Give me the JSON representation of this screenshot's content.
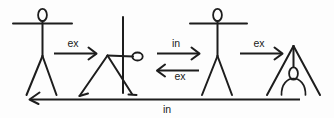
{
  "diagram": {
    "background_color": "#fdfdfd",
    "ink_color": "#1d1d1d",
    "figures": [
      {
        "id": "figure-standing-1",
        "name": "standing-figure",
        "pose": "standing upright, arms outstretched horizontally",
        "position": 1
      },
      {
        "id": "figure-forward-bend",
        "name": "forward-bend-figure",
        "pose": "bent forward at hips, back horizontal, arms raised vertically",
        "position": 2
      },
      {
        "id": "figure-standing-2",
        "name": "standing-figure",
        "pose": "standing upright, arms outstretched horizontally",
        "position": 3
      },
      {
        "id": "figure-deep-fold",
        "name": "deep-forward-fold-figure",
        "pose": "deep forward fold, head down between legs, arms hanging",
        "position": 4
      }
    ],
    "arrows": [
      {
        "id": "arrow-1",
        "name": "arrow-ex-1",
        "label": "ex",
        "direction": "right",
        "label_position": "above",
        "from": "figure-standing-1",
        "to": "figure-forward-bend"
      },
      {
        "id": "arrow-2",
        "name": "arrow-in-1",
        "label": "in",
        "direction": "right",
        "label_position": "above",
        "from": "figure-forward-bend",
        "to": "figure-standing-2"
      },
      {
        "id": "arrow-3",
        "name": "arrow-ex-2",
        "label": "ex",
        "direction": "left",
        "label_position": "below",
        "from": "figure-standing-2",
        "to": "figure-forward-bend"
      },
      {
        "id": "arrow-4",
        "name": "arrow-ex-3",
        "label": "ex",
        "direction": "right",
        "label_position": "above",
        "from": "figure-standing-2",
        "to": "figure-deep-fold"
      },
      {
        "id": "arrow-5",
        "name": "arrow-in-return",
        "label": "in",
        "direction": "left",
        "label_position": "below",
        "from": "figure-deep-fold",
        "to": "figure-standing-1"
      }
    ],
    "labels": {
      "exhale_short": "ex",
      "inhale_short": "in",
      "return_label": "in"
    }
  }
}
